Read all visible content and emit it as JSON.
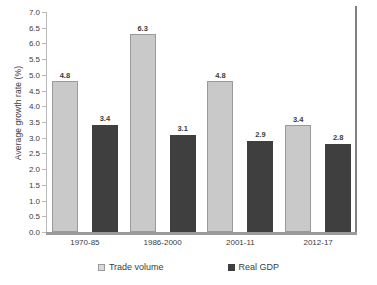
{
  "chart_data": {
    "type": "bar",
    "title": "",
    "xlabel": "",
    "ylabel": "Average growth rate (%)",
    "ylim": [
      0.0,
      7.0
    ],
    "ytick_step": 0.5,
    "grid": false,
    "legend_position": "bottom",
    "categories": [
      "1970-85",
      "1986-2000",
      "2001-11",
      "2012-17"
    ],
    "yticks": [
      "0.0",
      "0.5",
      "1.0",
      "1.5",
      "2.0",
      "2.5",
      "3.0",
      "3.5",
      "4.0",
      "4.5",
      "5.0",
      "5.5",
      "6.0",
      "6.5",
      "7.0"
    ],
    "series": [
      {
        "name": "Trade volume",
        "color": "#c9c9c9",
        "values": [
          4.8,
          6.3,
          4.8,
          3.4
        ],
        "labels": [
          "4.8",
          "6.3",
          "4.8",
          "3.4"
        ]
      },
      {
        "name": "Real GDP",
        "color": "#3f3f3f",
        "values": [
          3.4,
          3.1,
          2.9,
          2.8
        ],
        "labels": [
          "3.4",
          "3.1",
          "2.9",
          "2.8"
        ]
      }
    ]
  }
}
